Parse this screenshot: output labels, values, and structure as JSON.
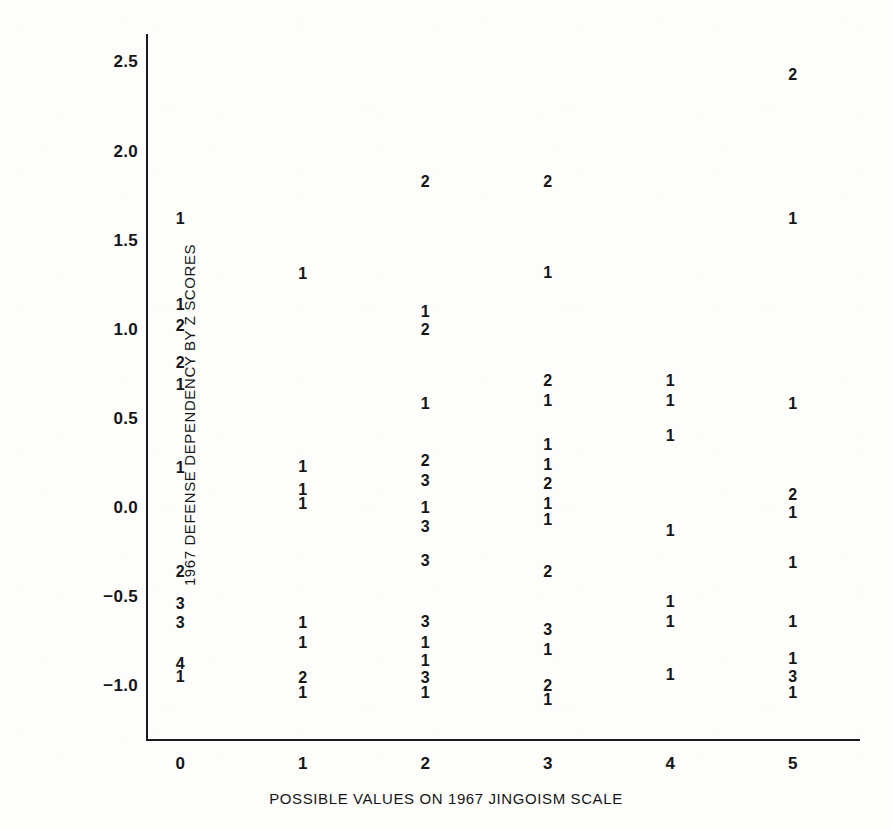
{
  "chart_data": {
    "type": "scatter",
    "title": "",
    "xlabel": "POSSIBLE VALUES ON 1967 JINGOISM SCALE",
    "ylabel": "1967 DEFENSE DEPENDENCY BY Z SCORES",
    "xlim": [
      -0.28,
      5.55
    ],
    "ylim": [
      -1.3,
      2.66
    ],
    "grid": false,
    "legend": null,
    "xticks": [
      0,
      1,
      2,
      3,
      4,
      5
    ],
    "xticklabels": [
      "0",
      "1",
      "2",
      "3",
      "4",
      "5"
    ],
    "yticks": [
      2.5,
      2.0,
      1.5,
      1.0,
      0.5,
      0.0,
      -0.5,
      -1.0
    ],
    "yticklabels": [
      "2.5",
      "2.0",
      "1.5",
      "1.0",
      "0.5",
      "0.0",
      "−0.5",
      "−1.0"
    ],
    "marker_style": "numeric-count-label",
    "note": "Each plotted glyph is a digit giving the number of coincident cases at that (x,y) location.",
    "points": [
      {
        "x": 0,
        "y": 1.62,
        "label": "1"
      },
      {
        "x": 0,
        "y": 1.14,
        "label": "1"
      },
      {
        "x": 0,
        "y": 1.02,
        "label": "2"
      },
      {
        "x": 0,
        "y": 0.81,
        "label": "2"
      },
      {
        "x": 0,
        "y": 0.69,
        "label": "1"
      },
      {
        "x": 0,
        "y": 0.22,
        "label": "1"
      },
      {
        "x": 0,
        "y": -0.36,
        "label": "2"
      },
      {
        "x": 0,
        "y": -0.54,
        "label": "3"
      },
      {
        "x": 0,
        "y": -0.65,
        "label": "3"
      },
      {
        "x": 0,
        "y": -0.88,
        "label": "4"
      },
      {
        "x": 0,
        "y": -0.95,
        "label": "1"
      },
      {
        "x": 1,
        "y": 1.31,
        "label": "1"
      },
      {
        "x": 1,
        "y": 0.23,
        "label": "1"
      },
      {
        "x": 1,
        "y": 0.1,
        "label": "1"
      },
      {
        "x": 1,
        "y": 0.02,
        "label": "1"
      },
      {
        "x": 1,
        "y": -0.65,
        "label": "1"
      },
      {
        "x": 1,
        "y": -0.76,
        "label": "1"
      },
      {
        "x": 1,
        "y": -0.96,
        "label": "2"
      },
      {
        "x": 1,
        "y": -1.04,
        "label": "1"
      },
      {
        "x": 2,
        "y": 1.83,
        "label": "2"
      },
      {
        "x": 2,
        "y": 1.1,
        "label": "1"
      },
      {
        "x": 2,
        "y": 1.0,
        "label": "2"
      },
      {
        "x": 2,
        "y": 0.58,
        "label": "1"
      },
      {
        "x": 2,
        "y": 0.26,
        "label": "2"
      },
      {
        "x": 2,
        "y": 0.15,
        "label": "3"
      },
      {
        "x": 2,
        "y": 0.0,
        "label": "1"
      },
      {
        "x": 2,
        "y": -0.11,
        "label": "3"
      },
      {
        "x": 2,
        "y": -0.3,
        "label": "3"
      },
      {
        "x": 2,
        "y": -0.64,
        "label": "3"
      },
      {
        "x": 2,
        "y": -0.76,
        "label": "1"
      },
      {
        "x": 2,
        "y": -0.86,
        "label": "1"
      },
      {
        "x": 2,
        "y": -0.96,
        "label": "3"
      },
      {
        "x": 2,
        "y": -1.04,
        "label": "1"
      },
      {
        "x": 3,
        "y": 1.83,
        "label": "2"
      },
      {
        "x": 3,
        "y": 1.32,
        "label": "1"
      },
      {
        "x": 3,
        "y": 0.71,
        "label": "2"
      },
      {
        "x": 3,
        "y": 0.6,
        "label": "1"
      },
      {
        "x": 3,
        "y": 0.35,
        "label": "1"
      },
      {
        "x": 3,
        "y": 0.24,
        "label": "1"
      },
      {
        "x": 3,
        "y": 0.13,
        "label": "2"
      },
      {
        "x": 3,
        "y": 0.02,
        "label": "1"
      },
      {
        "x": 3,
        "y": -0.07,
        "label": "1"
      },
      {
        "x": 3,
        "y": -0.36,
        "label": "2"
      },
      {
        "x": 3,
        "y": -0.69,
        "label": "3"
      },
      {
        "x": 3,
        "y": -0.8,
        "label": "1"
      },
      {
        "x": 3,
        "y": -1.0,
        "label": "2"
      },
      {
        "x": 3,
        "y": -1.08,
        "label": "1"
      },
      {
        "x": 4,
        "y": 0.71,
        "label": "1"
      },
      {
        "x": 4,
        "y": 0.6,
        "label": "1"
      },
      {
        "x": 4,
        "y": 0.4,
        "label": "1"
      },
      {
        "x": 4,
        "y": -0.13,
        "label": "1"
      },
      {
        "x": 4,
        "y": -0.53,
        "label": "1"
      },
      {
        "x": 4,
        "y": -0.64,
        "label": "1"
      },
      {
        "x": 4,
        "y": -0.94,
        "label": "1"
      },
      {
        "x": 5,
        "y": 2.43,
        "label": "2"
      },
      {
        "x": 5,
        "y": 1.62,
        "label": "1"
      },
      {
        "x": 5,
        "y": 0.58,
        "label": "1"
      },
      {
        "x": 5,
        "y": 0.07,
        "label": "2"
      },
      {
        "x": 5,
        "y": -0.03,
        "label": "1"
      },
      {
        "x": 5,
        "y": -0.31,
        "label": "1"
      },
      {
        "x": 5,
        "y": -0.64,
        "label": "1"
      },
      {
        "x": 5,
        "y": -0.85,
        "label": "1"
      },
      {
        "x": 5,
        "y": -0.95,
        "label": "3"
      },
      {
        "x": 5,
        "y": -1.04,
        "label": "1"
      }
    ]
  },
  "colors": {
    "ink": "#161616",
    "axis": "#1a1a1a",
    "paper": "#fdfdfc"
  }
}
